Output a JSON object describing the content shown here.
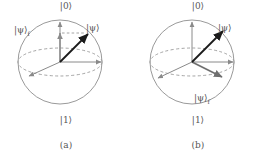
{
  "figure": {
    "panels": [
      {
        "id": "a",
        "caption": "(a)",
        "pole_top": "|0⟩",
        "pole_bottom": "|1⟩",
        "state_label": "|ψ⟩",
        "final_state_label": "|ψ⟩",
        "final_state_sub": "f",
        "description": "Bloch sphere with state vector and final state collapsed onto the |0⟩ axis"
      },
      {
        "id": "b",
        "caption": "(b)",
        "pole_top": "|0⟩",
        "pole_bottom": "|1⟩",
        "state_label": "|ψ⟩",
        "final_state_label": "|ψ⟩",
        "final_state_sub": "f",
        "description": "Bloch sphere with state vector and final state projected into the equatorial plane"
      }
    ]
  },
  "colors": {
    "sphere_outline": "#9a9a9a",
    "equator_dashed": "#9a9a9a",
    "axis_gray": "#8a8a8a",
    "state_vector": "#1a1a1a",
    "label_text": "#555555",
    "background": "#ffffff"
  },
  "geometry": {
    "sphere_radius": 42,
    "center_a": [
      60,
      62
    ],
    "center_b": [
      60,
      62
    ],
    "equator_ry": 14
  }
}
